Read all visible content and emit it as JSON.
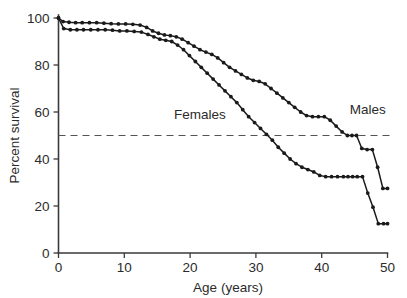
{
  "chart_data": {
    "type": "line",
    "title": "",
    "subtitle": "",
    "xlabel": "Age (years)",
    "ylabel": "Percent survival",
    "xlim": [
      0,
      50
    ],
    "ylim": [
      0,
      100
    ],
    "xticks": [
      0,
      10,
      20,
      30,
      40,
      50
    ],
    "xtick_labels": [
      "0",
      "10",
      "20",
      "30",
      "40",
      "50"
    ],
    "yticks": [
      0,
      20,
      40,
      60,
      80,
      100
    ],
    "ytick_labels": [
      "0",
      "20",
      "40",
      "60",
      "80",
      "100"
    ],
    "grid": false,
    "legend_position": "inline-annotation",
    "annotations": [
      {
        "text": "Females",
        "x": 21.5,
        "y": 57
      },
      {
        "text": "Males",
        "x": 47.0,
        "y": 59
      }
    ],
    "reference_lines": [
      {
        "label": "50 percent survival",
        "orientation": "horizontal",
        "y": 50,
        "style": "dashed"
      }
    ],
    "series": [
      {
        "name": "Females",
        "marker": "filled-circle",
        "x": [
          0,
          0.7,
          1.6,
          2.6,
          3.6,
          4.7,
          5.8,
          6.9,
          8.0,
          9.1,
          10.2,
          11.3,
          12.4,
          13.4,
          14.3,
          15.2,
          16.1,
          17.0,
          17.9,
          18.8,
          19.7,
          20.6,
          21.5,
          22.4,
          23.3,
          24.2,
          25.1,
          26.0,
          26.9,
          27.8,
          28.7,
          29.6,
          30.5,
          31.4,
          32.3,
          33.2,
          34.1,
          35.0,
          35.9,
          36.8,
          37.7,
          38.6,
          39.5,
          40.4,
          41.3,
          42.2,
          43.1,
          43.9,
          44.6,
          45.3,
          46.1,
          46.9,
          47.7,
          48.5,
          49.3,
          50.0
        ],
        "y": [
          100,
          98.5,
          98.2,
          98.0,
          98.0,
          98.0,
          98.0,
          97.8,
          97.6,
          97.5,
          97.5,
          97.3,
          97.0,
          96.0,
          94.5,
          93.5,
          92.8,
          92.5,
          92.0,
          91.0,
          89.5,
          88.0,
          86.5,
          85.5,
          84.5,
          83.0,
          81.0,
          79.0,
          77.5,
          76.0,
          74.5,
          73.5,
          73.0,
          72.0,
          70.0,
          68.0,
          66.0,
          64.0,
          62.0,
          60.0,
          58.5,
          58.0,
          58.0,
          58.0,
          56.5,
          54.0,
          51.5,
          50.0,
          50.0,
          50.0,
          44.5,
          44.0,
          44.0,
          36.5,
          27.5,
          27.5
        ]
      },
      {
        "name": "Males",
        "marker": "filled-circle",
        "x": [
          0,
          0.8,
          1.8,
          2.8,
          3.8,
          4.9,
          6.0,
          7.1,
          8.2,
          9.3,
          10.4,
          11.5,
          12.6,
          13.6,
          14.5,
          15.4,
          16.3,
          17.2,
          18.1,
          19.0,
          19.9,
          20.8,
          21.7,
          22.6,
          23.5,
          24.4,
          25.3,
          26.2,
          27.1,
          28.0,
          28.9,
          29.8,
          30.7,
          31.6,
          32.5,
          33.4,
          34.3,
          35.2,
          36.1,
          37.0,
          37.9,
          38.8,
          39.7,
          40.6,
          41.5,
          42.4,
          43.3,
          44.0,
          44.7,
          45.4,
          46.2,
          47.0,
          47.8,
          48.6,
          49.4,
          50.0
        ],
        "y": [
          100,
          95.5,
          95.0,
          95.0,
          95.0,
          95.0,
          95.0,
          95.0,
          94.8,
          94.5,
          94.5,
          94.3,
          94.0,
          93.0,
          92.0,
          91.0,
          90.5,
          90.0,
          88.5,
          86.5,
          84.0,
          81.5,
          79.0,
          76.5,
          74.0,
          71.5,
          69.0,
          66.5,
          64.0,
          61.0,
          58.0,
          55.5,
          53.0,
          50.5,
          48.0,
          45.0,
          42.5,
          40.0,
          38.0,
          36.5,
          35.5,
          34.5,
          33.0,
          32.5,
          32.5,
          32.5,
          32.5,
          32.5,
          32.5,
          32.5,
          32.5,
          25.5,
          19.5,
          12.5,
          12.5,
          12.5
        ]
      }
    ]
  }
}
